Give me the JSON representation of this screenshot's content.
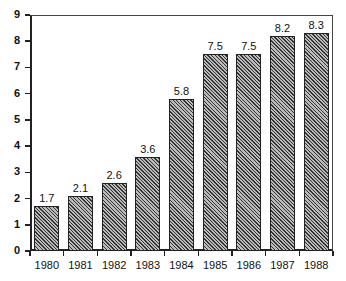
{
  "chart_data": {
    "type": "bar",
    "title": "",
    "xlabel": "",
    "ylabel": "",
    "categories": [
      "1980",
      "1981",
      "1982",
      "1983",
      "1984",
      "1985",
      "1986",
      "1987",
      "1988"
    ],
    "values": [
      1.7,
      2.1,
      2.6,
      3.6,
      5.8,
      7.5,
      7.5,
      8.2,
      8.3
    ],
    "data_labels": [
      "1.7",
      "2.1",
      "2.6",
      "3.6",
      "5.8",
      "7.5",
      "7.5",
      "8.2",
      "8.3"
    ],
    "ylim": [
      0,
      9
    ],
    "yticks": [
      "0",
      "1",
      "2",
      "3",
      "4",
      "5",
      "6",
      "7",
      "8",
      "9"
    ],
    "grid": false,
    "legend": null,
    "bar_fill": "diagonal hatch",
    "bar_color": "#9a9a9a"
  }
}
